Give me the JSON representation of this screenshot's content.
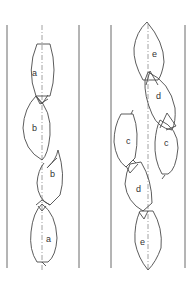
{
  "diagram": {
    "left_panel": {
      "labels": [
        "a",
        "b",
        "b",
        "a"
      ]
    },
    "right_panel": {
      "labels": [
        "e",
        "d",
        "c",
        "c",
        "d",
        "e"
      ]
    }
  },
  "colors": {
    "line": "#4a4a4a",
    "wall": "#6a6a6a",
    "axis": "#8a8a8a"
  }
}
